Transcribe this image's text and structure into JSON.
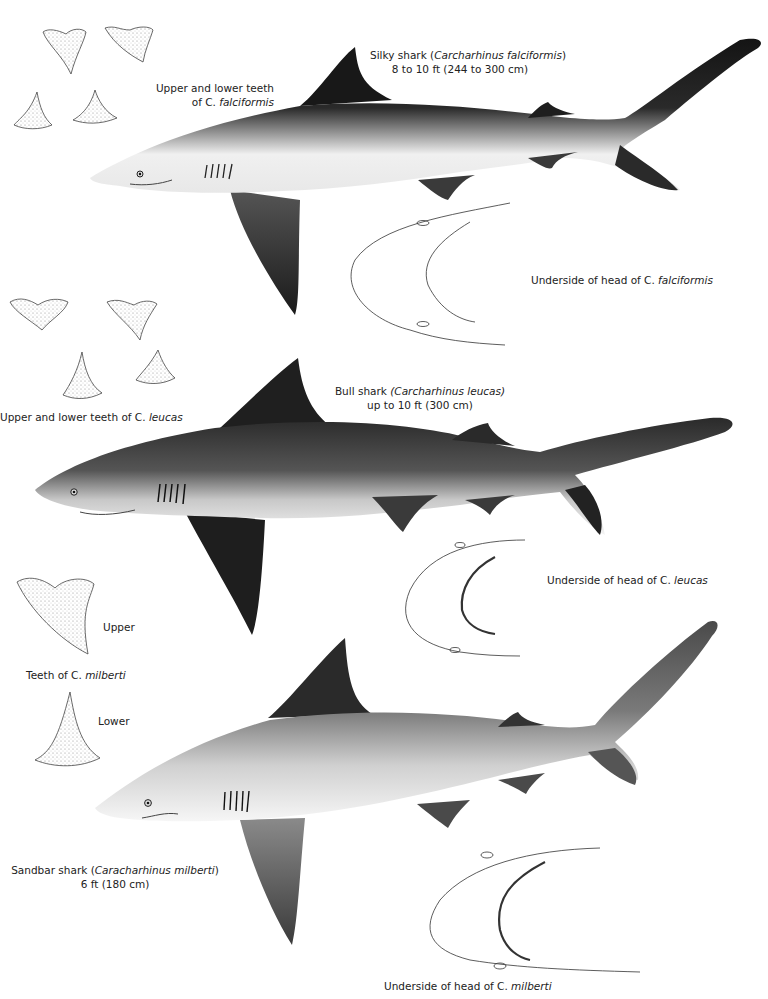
{
  "plate": {
    "sharks": [
      {
        "id": "silky",
        "common_name": "Silky shark",
        "scientific_name": "Carcharhinus falciformis",
        "size": "8 to 10 ft (244 to 300 cm)",
        "teeth_label_line1": "Upper and lower teeth",
        "teeth_label_line2_prefix": "of C. ",
        "teeth_label_line2_species": "falciformis",
        "head_label_prefix": "Underside of head of C. ",
        "head_label_species": "falciformis"
      },
      {
        "id": "bull",
        "common_name": "Bull shark",
        "scientific_name": "Carcharhinus leucas",
        "size": "up to 10 ft (300 cm)",
        "teeth_label_prefix": "Upper and lower teeth of C. ",
        "teeth_label_species": "leucas",
        "head_label_prefix": "Underside of head of C. ",
        "head_label_species": "leucas"
      },
      {
        "id": "sandbar",
        "common_name": "Sandbar shark",
        "scientific_name": "Caracharhinus milberti",
        "size": "6 ft (180 cm)",
        "teeth_label_prefix": "Teeth of C. ",
        "teeth_label_species": "milberti",
        "teeth_upper": "Upper",
        "teeth_lower": "Lower",
        "head_label_prefix": "Underside of head of C. ",
        "head_label_species": "milberti"
      }
    ],
    "colors": {
      "background": "#ffffff",
      "shark_dark": "#1a1a1a",
      "shark_mid": "#6b6b6b",
      "shark_belly": "#f2f2f2",
      "line_art": "#333333"
    }
  }
}
